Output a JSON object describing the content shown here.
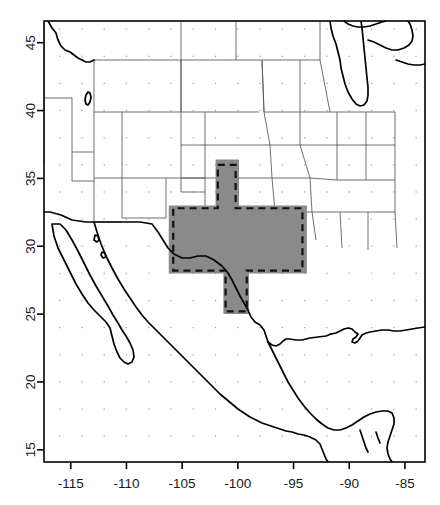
{
  "figure": {
    "name": "study-region-map",
    "type": "geographic-map",
    "width": 440,
    "height": 505,
    "background_color": "#ffffff"
  },
  "chart_data": {
    "type": "map",
    "title": "",
    "subtitle": "",
    "xlabel": "",
    "ylabel": "",
    "projection": "equirectangular",
    "xlim": [
      -117.4,
      -83.2
    ],
    "ylim": [
      14.1,
      46.6
    ],
    "xticks": [
      -115,
      -110,
      -105,
      -100,
      -95,
      -90,
      -85
    ],
    "xtick_labels": [
      "-115",
      "-110",
      "-105",
      "-100",
      "-95",
      "-90",
      "-85"
    ],
    "yticks": [
      15,
      20,
      25,
      30,
      35,
      40,
      45
    ],
    "ytick_labels": [
      "15",
      "20",
      "25",
      "30",
      "35",
      "40",
      "45"
    ],
    "ytick_label_rotation": -90,
    "grid": false,
    "grid_dots": {
      "visible": true,
      "lon_spacing": 2,
      "lat_spacing": 2,
      "color": "#9a9a9a"
    },
    "legend": {
      "visible": false,
      "position": "none",
      "entries": []
    },
    "layers": [
      {
        "name": "coastlines-and-national-borders",
        "stroke_color": "#000000",
        "stroke_width": 1.7
      },
      {
        "name": "state-and-province-borders",
        "stroke_color": "#555555",
        "stroke_width": 0.85
      }
    ],
    "annotations": [
      {
        "name": "shaded-study-region",
        "kind": "filled-polygon",
        "fill_color": "#8a8a8a",
        "description": "Gray shaded domain covering Texas and surroundings",
        "bounds_lon": [
          -106.2,
          -93.8
        ],
        "bounds_lat": [
          25.0,
          36.4
        ]
      },
      {
        "name": "dashed-region-outline",
        "kind": "dashed-polygon",
        "stroke_color": "#111111",
        "stroke_width": 2.2,
        "dash_pattern": "7 5",
        "description": "Dashed boundary inset within the gray shaded domain",
        "bounds_lon": [
          -105.8,
          -94.2
        ],
        "bounds_lat": [
          25.2,
          36.0
        ]
      }
    ],
    "shaded_region_polygon_lonlat": [
      [
        -102.0,
        36.4
      ],
      [
        -99.9,
        36.4
      ],
      [
        -99.9,
        33.0
      ],
      [
        -93.8,
        33.0
      ],
      [
        -93.8,
        28.0
      ],
      [
        -99.0,
        28.0
      ],
      [
        -99.0,
        25.0
      ],
      [
        -101.3,
        25.0
      ],
      [
        -101.3,
        28.0
      ],
      [
        -106.2,
        28.0
      ],
      [
        -106.2,
        33.0
      ],
      [
        -102.0,
        33.0
      ]
    ],
    "dashed_region_polygon_lonlat": [
      [
        -101.8,
        36.0
      ],
      [
        -100.2,
        36.0
      ],
      [
        -100.2,
        32.8
      ],
      [
        -94.2,
        32.8
      ],
      [
        -94.2,
        28.2
      ],
      [
        -99.2,
        28.2
      ],
      [
        -99.2,
        25.2
      ],
      [
        -101.1,
        25.2
      ],
      [
        -101.1,
        28.2
      ],
      [
        -105.8,
        28.2
      ],
      [
        -105.8,
        32.8
      ],
      [
        -101.8,
        32.8
      ]
    ]
  },
  "axes": {
    "frame_color": "#000000",
    "tick_color": "#000000",
    "label_color": "#1a1a1a"
  }
}
